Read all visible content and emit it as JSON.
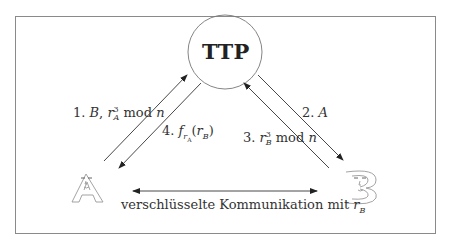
{
  "diagram": {
    "type": "protocol-diagram",
    "center_node": {
      "label": "TTP"
    },
    "parties": [
      {
        "id": "A",
        "label": "A",
        "style": "outlined letter with face"
      },
      {
        "id": "B",
        "label": "B",
        "style": "outlined letter with face"
      }
    ],
    "messages": [
      {
        "step": "1.",
        "from": "A",
        "to": "TTP",
        "text_parts": [
          "B, r",
          "3",
          "A",
          " mod ",
          "n"
        ],
        "display": "1. B, r_A^3 mod n"
      },
      {
        "step": "2.",
        "from": "TTP",
        "to": "B",
        "text_parts": [
          "A"
        ],
        "display": "2. A"
      },
      {
        "step": "3.",
        "from": "B",
        "to": "TTP",
        "text_parts": [
          "r",
          "3",
          "B",
          " mod ",
          "n"
        ],
        "display": "3. r_B^3 mod n"
      },
      {
        "step": "4.",
        "from": "TTP",
        "to": "A",
        "text_parts": [
          "f",
          "r",
          "A",
          "(r",
          "B",
          ")"
        ],
        "display": "4. f_{r_A}(r_B)"
      }
    ],
    "channel": {
      "from": "A",
      "to": "B",
      "bidirectional": true,
      "text": "verschlüsselte Kommunikation mit ",
      "var": "r",
      "sub": "B"
    },
    "colors": {
      "line": "#333333",
      "frame": "#888888",
      "background": "#ffffff"
    }
  }
}
